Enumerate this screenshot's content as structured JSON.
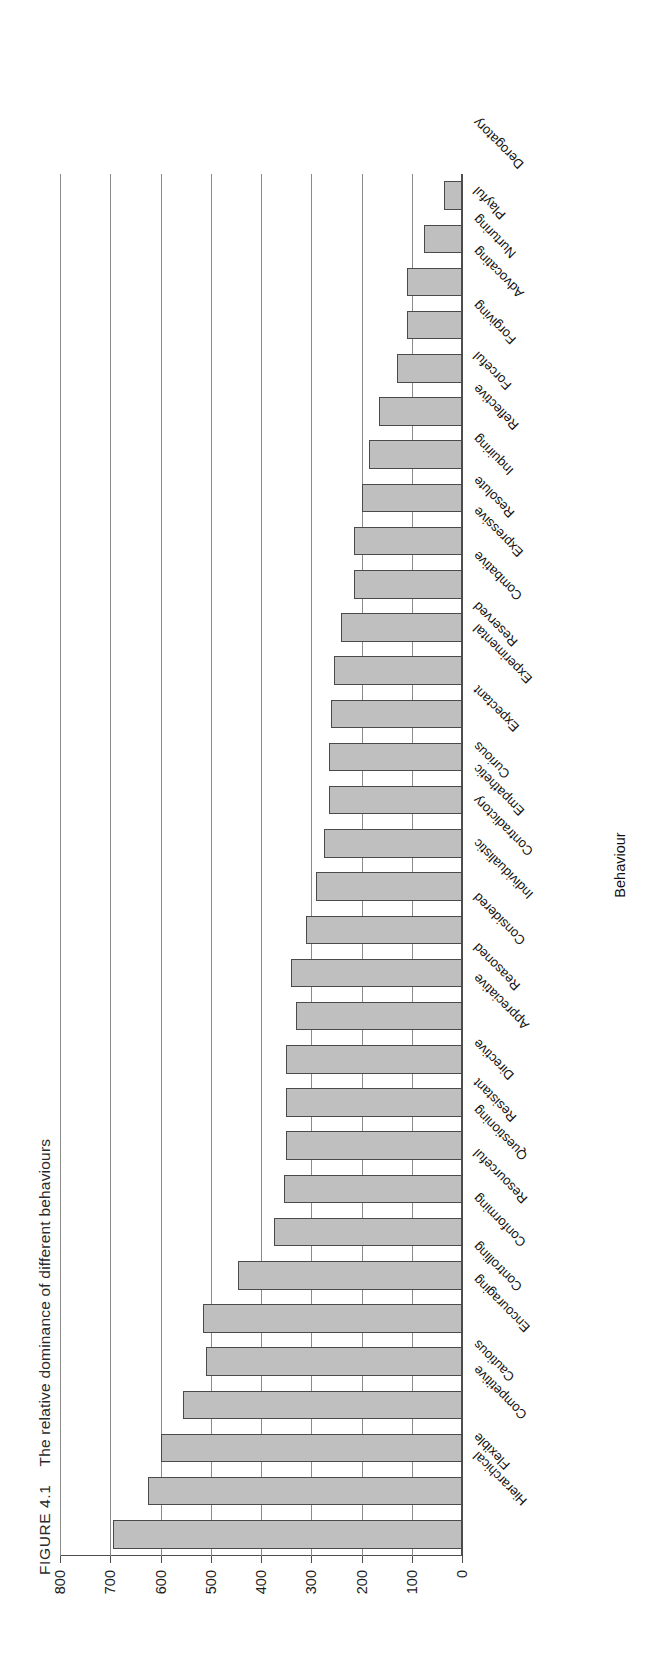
{
  "caption": {
    "figure_number": "FIGURE 4.1",
    "text": "The relative dominance of different behaviours",
    "full": "FIGURE 4.1    The relative dominance of different behaviours"
  },
  "axis": {
    "value_axis_title": "",
    "category_axis_title": "Behaviour",
    "value_ticks": [
      "0",
      "100",
      "200",
      "300",
      "400",
      "500",
      "600",
      "700",
      "800"
    ]
  },
  "colors": {
    "bar_fill": "#bfbfbf",
    "bar_stroke": "#4a4a4a",
    "grid": "#8a8a8a",
    "axis": "#4d4d4d",
    "text": "#111111",
    "background": "#ffffff"
  },
  "chart_data": {
    "type": "bar",
    "title": "The relative dominance of different behaviours",
    "xlabel": "Behaviour",
    "ylabel": "",
    "ylim": [
      0,
      800
    ],
    "grid": true,
    "legend": null,
    "orientation": "vertical",
    "categories": [
      "Hierarchical",
      "Flexible",
      "Competitive",
      "Cautious",
      "Encouraging",
      "Controlling",
      "Conforming",
      "Resourceful",
      "Questioning",
      "Resistant",
      "Directive",
      "Appreciative",
      "Reasoned",
      "Considered",
      "Individualistic",
      "Contradictory",
      "Empathetic",
      "Curious",
      "Expectant",
      "Experimental",
      "Reserved",
      "Combative",
      "Expressive",
      "Resolute",
      "Inquiring",
      "Reflective",
      "Forceful",
      "Forgiving",
      "Advocating",
      "Nurturing",
      "Playful",
      "Derogatory"
    ],
    "values": [
      695,
      625,
      600,
      555,
      510,
      515,
      445,
      375,
      355,
      350,
      350,
      350,
      330,
      340,
      310,
      290,
      275,
      265,
      265,
      260,
      255,
      240,
      215,
      215,
      200,
      185,
      165,
      130,
      110,
      110,
      75,
      35
    ]
  }
}
